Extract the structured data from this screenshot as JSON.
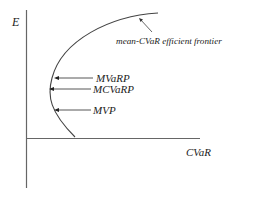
{
  "diagram": {
    "title": "mean-CVaR efficient frontier",
    "axes": {
      "y_label": "E",
      "x_label": "CVaR"
    },
    "curve": {
      "label": "mean-CVaR efficient frontier"
    },
    "points": [
      {
        "id": "mvarp",
        "label": "MVaRP"
      },
      {
        "id": "mcvarp",
        "label": "MCVaRP"
      },
      {
        "id": "mvp",
        "label": "MVP"
      }
    ],
    "colors": {
      "line": "#555555",
      "text": "#222222",
      "background": "#ffffff"
    }
  }
}
